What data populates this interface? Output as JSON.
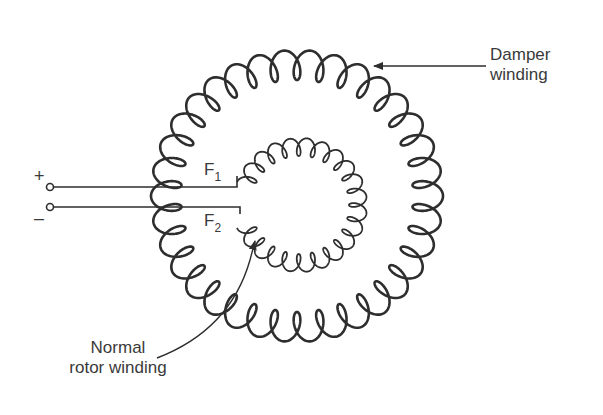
{
  "diagram": {
    "type": "winding-diagram",
    "labels": {
      "damper": {
        "line1": "Damper",
        "line2": "winding"
      },
      "normal": {
        "line1": "Normal",
        "line2": "rotor winding"
      },
      "f1": {
        "main": "F",
        "sub": "1"
      },
      "f2": {
        "main": "F",
        "sub": "2"
      },
      "plus": "+",
      "minus": "–"
    },
    "nodes": [
      {
        "id": "plus-terminal",
        "label": "+"
      },
      {
        "id": "minus-terminal",
        "label": "–"
      },
      {
        "id": "damper-winding",
        "label": "Damper winding"
      },
      {
        "id": "rotor-winding",
        "label": "Normal rotor winding"
      },
      {
        "id": "F1",
        "label": "F1"
      },
      {
        "id": "F2",
        "label": "F2"
      }
    ],
    "edges": [
      {
        "from": "plus-terminal",
        "to": "F1"
      },
      {
        "from": "minus-terminal",
        "to": "F2"
      }
    ],
    "stroke_color": "#2e2e2e",
    "text_color": "#3a3a3a"
  }
}
